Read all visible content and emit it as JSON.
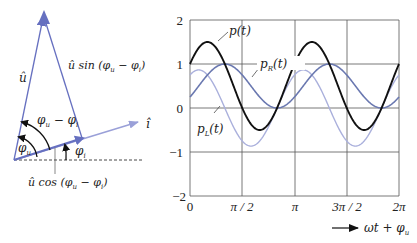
{
  "phasor_diagram": {
    "u_label": "û",
    "u_sin_label": "û sin (φ",
    "u_sin_sub_u": "u",
    "u_sin_mid": " − φ",
    "u_sin_sub_i": "i",
    "u_sin_end": ")",
    "i_label": "î",
    "angle_diff_label": "φ",
    "angle_diff_sub_u": "u",
    "angle_diff_mid": " − φ",
    "angle_diff_sub_i": "i",
    "phi_u_label": "φ",
    "phi_u_sub": "u",
    "phi_i_label": "φ",
    "phi_i_sub": "i",
    "u_cos_label": "û cos (φ",
    "u_cos_sub_u": "u",
    "u_cos_mid": " − φ",
    "u_cos_sub_i": "i",
    "u_cos_end": ")",
    "colors": {
      "u_phasor": "#6670c0",
      "i_phasor": "#9aa0d8",
      "angle_arrows": "#111111"
    }
  },
  "chart_data": {
    "type": "line",
    "title": "",
    "xlabel": "ωt + φu",
    "ylabel": "",
    "xlim": [
      0,
      6.2832
    ],
    "ylim": [
      -2,
      2
    ],
    "grid": true,
    "x_ticks": [
      "0",
      "π / 2",
      "π",
      "3π / 2",
      "2π"
    ],
    "y_ticks": [
      "2",
      "1",
      "0",
      "−1",
      "−2"
    ],
    "series": [
      {
        "name": "p(t)",
        "label": "p",
        "sub": "",
        "arg": "(t)",
        "formula": "0.5 + 1.0·sin(2x + π/6)",
        "color": "#111111",
        "mean": 0.5,
        "amp": 1.0,
        "phase": 0.5236,
        "values_at_ticks": [
          1.0,
          0.0,
          1.0,
          0.0,
          1.0
        ]
      },
      {
        "name": "p_R(t)",
        "label": "p",
        "sub": "R",
        "arg": "(t)",
        "formula": "0.5 + 0.5·sin(2x − π/6)",
        "color": "#6a78b0",
        "mean": 0.5,
        "amp": 0.5,
        "phase": -0.5236,
        "values_at_ticks": [
          0.25,
          0.75,
          0.25,
          0.75,
          0.25
        ]
      },
      {
        "name": "p_L(t)",
        "label": "p",
        "sub": "L",
        "arg": "(t)",
        "formula": "0.866·sin(2x + π/3)",
        "color": "#aab0dc",
        "mean": 0.0,
        "amp": 0.866,
        "phase": 1.0472,
        "values_at_ticks": [
          0.75,
          -0.75,
          0.75,
          -0.75,
          0.75
        ]
      }
    ],
    "annotations": [
      "p(t)",
      "p_R(t)",
      "p_L(t)"
    ],
    "axis_label": {
      "arrow": "→",
      "text_main": "ωt + φ",
      "text_sub": "u"
    }
  }
}
